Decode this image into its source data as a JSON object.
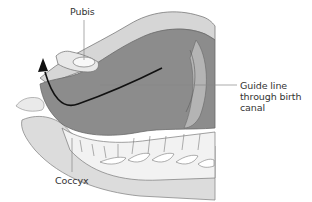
{
  "figure": {
    "type": "anatomical sagittal section",
    "colors": {
      "soft_tissue": "#8a8a8a",
      "outer_tissue": "#c8c8c8",
      "bone": "#e6e6e6",
      "pale": "#f0f0f0",
      "outline": "#7a7a7a",
      "guide_line": "#111111",
      "leader": "#888888"
    }
  },
  "labels": {
    "pubis": "Pubis",
    "guide_line_1": "Guide line",
    "guide_line_2": "through birth",
    "guide_line_3": "canal",
    "coccyx": "Coccyx"
  }
}
